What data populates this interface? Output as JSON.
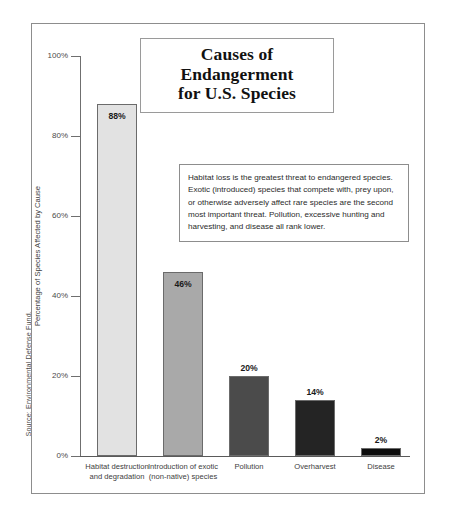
{
  "source_credit": "Source: Environmental Defense Fund.",
  "title": {
    "line1": "Causes of Endangerment",
    "line2": "for U.S. Species"
  },
  "annotation": {
    "text": "Habitat loss is the greatest threat to endangered species. Exotic (introduced) species that compete with, prey upon, or otherwise adversely affect rare species are the second most important threat. Pollution, excessive hunting and harvesting, and disease all rank lower."
  },
  "axis": {
    "y_title": "Percentage of Species Affected by Cause",
    "y_ticks": [
      "0%",
      "20%",
      "40%",
      "60%",
      "80%",
      "100%"
    ]
  },
  "bars": [
    {
      "label_line1": "Habitat destruction",
      "label_line2": "and degradation",
      "value_label": "88%",
      "value": 88,
      "color": "#e2e2e2",
      "label_position": "inside"
    },
    {
      "label_line1": "Introduction of exotic",
      "label_line2": "(non-native) species",
      "value_label": "46%",
      "value": 46,
      "color": "#a9a9a9",
      "label_position": "inside"
    },
    {
      "label_line1": "Pollution",
      "label_line2": "",
      "value_label": "20%",
      "value": 20,
      "color": "#4b4b4b",
      "label_position": "above"
    },
    {
      "label_line1": "Overharvest",
      "label_line2": "",
      "value_label": "14%",
      "value": 14,
      "color": "#242424",
      "label_position": "above"
    },
    {
      "label_line1": "Disease",
      "label_line2": "",
      "value_label": "2%",
      "value": 2,
      "color": "#0d0d0d",
      "label_position": "above"
    }
  ],
  "chart_data": {
    "type": "bar",
    "title": "Causes of Endangerment for U.S. Species",
    "categories": [
      "Habitat destruction and degradation",
      "Introduction of exotic (non-native) species",
      "Pollution",
      "Overharvest",
      "Disease"
    ],
    "values": [
      88,
      46,
      20,
      14,
      2
    ],
    "value_labels": [
      "88%",
      "46%",
      "20%",
      "14%",
      "2%"
    ],
    "series": [
      {
        "name": "Percentage of Species Affected by Cause",
        "values": [
          88,
          46,
          20,
          14,
          2
        ]
      }
    ],
    "xlabel": "",
    "ylabel": "Percentage of Species Affected by Cause",
    "ylim": [
      0,
      100
    ],
    "ytick_values": [
      0,
      20,
      40,
      60,
      80,
      100
    ],
    "ytick_labels": [
      "0%",
      "20%",
      "40%",
      "60%",
      "80%",
      "100%"
    ],
    "grid": false,
    "legend": "none",
    "bar_colors": [
      "#e2e2e2",
      "#a9a9a9",
      "#4b4b4b",
      "#242424",
      "#0d0d0d"
    ],
    "annotations": [
      "Habitat loss is the greatest threat to endangered species. Exotic (introduced) species that compete with, prey upon, or otherwise adversely affect rare species are the second most important threat. Pollution, excessive hunting and harvesting, and disease all rank lower."
    ],
    "source": "Source: Environmental Defense Fund."
  }
}
